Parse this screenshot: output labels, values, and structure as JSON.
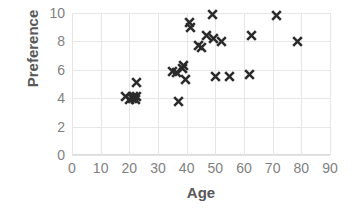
{
  "chart_data": {
    "type": "scatter",
    "title": "",
    "xlabel": "Age",
    "ylabel": "Preference",
    "xlim": [
      0,
      90
    ],
    "ylim": [
      0,
      10
    ],
    "xticks": [
      0,
      10,
      20,
      30,
      40,
      50,
      60,
      70,
      80,
      90
    ],
    "yticks": [
      0,
      2,
      4,
      6,
      8,
      10
    ],
    "grid": true,
    "legend": false,
    "marker": "x",
    "marker_color": "#2b2b2b",
    "grid_color": "#e6e6e6",
    "tick_label_color": "#7f7f7f",
    "axis_title_color": "#595959",
    "points": [
      {
        "x": 18.5,
        "y": 4.1
      },
      {
        "x": 20.0,
        "y": 3.9
      },
      {
        "x": 21.0,
        "y": 4.0
      },
      {
        "x": 21.5,
        "y": 4.1
      },
      {
        "x": 22.0,
        "y": 3.9
      },
      {
        "x": 22.5,
        "y": 4.1
      },
      {
        "x": 22.5,
        "y": 5.1
      },
      {
        "x": 35.0,
        "y": 5.9
      },
      {
        "x": 36.5,
        "y": 5.8
      },
      {
        "x": 37.0,
        "y": 3.8
      },
      {
        "x": 38.5,
        "y": 6.1
      },
      {
        "x": 39.0,
        "y": 6.3
      },
      {
        "x": 39.5,
        "y": 5.3
      },
      {
        "x": 41.0,
        "y": 9.3
      },
      {
        "x": 41.5,
        "y": 9.0
      },
      {
        "x": 44.0,
        "y": 7.7
      },
      {
        "x": 45.0,
        "y": 7.6
      },
      {
        "x": 47.0,
        "y": 8.4
      },
      {
        "x": 49.0,
        "y": 9.9
      },
      {
        "x": 49.5,
        "y": 8.2
      },
      {
        "x": 50.0,
        "y": 5.5
      },
      {
        "x": 52.0,
        "y": 8.0
      },
      {
        "x": 55.0,
        "y": 5.5
      },
      {
        "x": 62.0,
        "y": 5.7
      },
      {
        "x": 62.5,
        "y": 8.4
      },
      {
        "x": 71.5,
        "y": 9.8
      },
      {
        "x": 78.5,
        "y": 8.0
      }
    ]
  }
}
